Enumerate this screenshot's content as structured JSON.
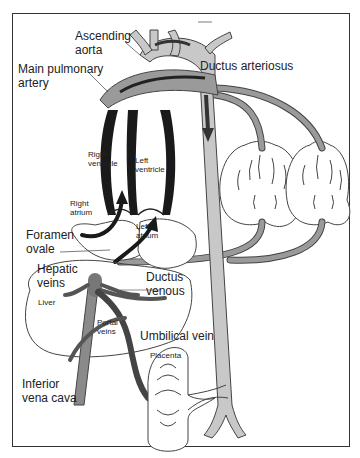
{
  "diagram": {
    "colors": {
      "frame": "#333333",
      "artery_light": "#c8c8c8",
      "vessel_mid": "#8a8a8a",
      "vessel_dark": "#555555",
      "ventricle_wall": "#1a1a1a",
      "outline": "#444444",
      "background": "#ffffff"
    },
    "labels": {
      "ascending_aorta": "Ascending aorta",
      "ductus_arteriosus": "Ductus arteriosus",
      "main_pulmonary_artery": "Main pulmonary artery",
      "right_ventricle": "Right ventricle",
      "left_ventricle": "Left ventricle",
      "right_atrium": "Right atrium",
      "left_atrium": "Left atrium",
      "foramen_ovale": "Foramen ovale",
      "hepatic_veins": "Hepatic veins",
      "ductus_venous": "Ductus venous",
      "liver": "Liver",
      "portal_veins": "Portal veins",
      "umbilical_vein": "Umbilical vein",
      "placenta": "Placenta",
      "inferior_vena_cava": "Inferior vena cava"
    },
    "structures": [
      "aortic arch",
      "descending aorta",
      "lungs (2)",
      "heart chambers (4)",
      "liver",
      "placenta",
      "umbilical arteries"
    ]
  }
}
